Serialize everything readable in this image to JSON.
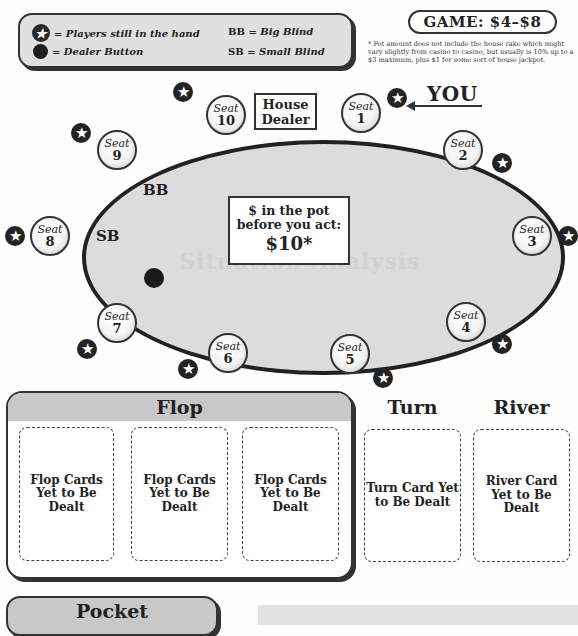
{
  "legend": {
    "items": [
      {
        "icon": "star-icon",
        "label": "= Players still in the hand"
      },
      {
        "icon": "dealer-button-icon",
        "label": "= Dealer Button"
      }
    ],
    "abbreviations": [
      {
        "abbr": "BB",
        "eq": " = ",
        "meaning": "Big Blind"
      },
      {
        "abbr": "SB",
        "eq": " = ",
        "meaning": "Small Blind"
      }
    ]
  },
  "game": {
    "label": "GAME: $4–$8",
    "footnote": "* Pot amount does not include the house rake which might vary slightly from casino to casino, but usually is 10% up to a $3 maximum, plus $1 for some sort of house jackpot."
  },
  "table": {
    "house_dealer": "House Dealer",
    "you_label": "YOU",
    "blinds": {
      "big": "BB",
      "small": "SB"
    },
    "pot": {
      "line1": "$ in the pot",
      "line2": "before you act:",
      "amount": "$10*"
    },
    "ghost_text": "Situation Analysis",
    "seat_word": "Seat",
    "seats": [
      {
        "number": "1",
        "in_hand": true
      },
      {
        "number": "2",
        "in_hand": true
      },
      {
        "number": "3",
        "in_hand": true
      },
      {
        "number": "4",
        "in_hand": true
      },
      {
        "number": "5",
        "in_hand": true
      },
      {
        "number": "6",
        "in_hand": true
      },
      {
        "number": "7",
        "in_hand": true
      },
      {
        "number": "8",
        "in_hand": true
      },
      {
        "number": "9",
        "in_hand": true
      },
      {
        "number": "10",
        "in_hand": true
      }
    ],
    "star_glyph": "★"
  },
  "board": {
    "flop": {
      "title": "Flop",
      "cards": [
        "Flop Cards Yet to Be Dealt",
        "Flop Cards Yet to Be Dealt",
        "Flop Cards Yet to Be Dealt"
      ]
    },
    "turn": {
      "title": "Turn",
      "card": "Turn Card Yet to Be Dealt"
    },
    "river": {
      "title": "River",
      "card": "River Card Yet to Be Dealt"
    }
  },
  "pocket": {
    "title": "Pocket"
  },
  "colors": {
    "table_felt": "#dcdcdc",
    "outline": "#222222",
    "panel_header": "#c8c8c8"
  }
}
